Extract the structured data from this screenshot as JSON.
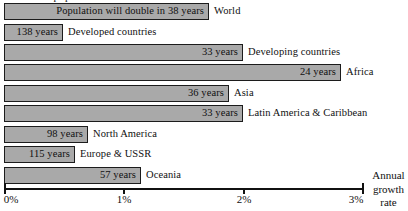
{
  "chart_data": {
    "type": "bar",
    "orientation": "horizontal",
    "title": "",
    "xlabel": "Annual growth rate",
    "ylabel": "",
    "xlim": [
      0,
      3
    ],
    "xunit": "%",
    "grid": false,
    "legend": null,
    "tick_labels": [
      "0%",
      "1%",
      "2%",
      "3%"
    ],
    "tick_values": [
      0,
      1,
      2,
      3
    ],
    "categories": [
      "World",
      "Developed countries",
      "Developing countries",
      "Africa",
      "Asia",
      "Latin America & Caribbean",
      "North America",
      "Europe & USSR",
      "Oceania"
    ],
    "values": [
      1.7,
      0.5,
      2.0,
      2.8,
      1.9,
      2.0,
      0.7,
      0.6,
      1.2
    ],
    "data_labels": [
      "Population will double in 38 years",
      "138 years",
      "33 years",
      "24 years",
      "36 years",
      "33 years",
      "98 years",
      "115 years",
      "57 years"
    ],
    "doubling_years": [
      38,
      138,
      33,
      24,
      36,
      33,
      98,
      115,
      57
    ],
    "bar_fill": "#a9a9a9",
    "bar_stroke": "#1c1c1c",
    "axis_color": "#111111"
  },
  "axis": {
    "caption_line1": "Annual",
    "caption_line2": "growth",
    "caption_line3": "rate",
    "ticks": [
      {
        "label": "0%",
        "x": 4
      },
      {
        "label": "1%",
        "x": 123
      },
      {
        "label": "2%",
        "x": 243
      },
      {
        "label": "3%",
        "x": 362
      }
    ]
  },
  "rows": [
    {
      "label": "World",
      "value_label": "Population will double in 38 years",
      "top": 3,
      "bar_end": 209
    },
    {
      "label": "Developed countries",
      "value_label": "138 years",
      "top": 24,
      "bar_end": 63
    },
    {
      "label": "Developing countries",
      "value_label": "33 years",
      "top": 44,
      "bar_end": 243
    },
    {
      "label": "Africa",
      "value_label": "24 years",
      "top": 64,
      "bar_end": 341
    },
    {
      "label": "Asia",
      "value_label": "36 years",
      "top": 85,
      "bar_end": 229
    },
    {
      "label": "Latin America & Caribbean",
      "value_label": "33 years",
      "top": 105,
      "bar_end": 243
    },
    {
      "label": "North America",
      "value_label": "98 years",
      "top": 126,
      "bar_end": 88
    },
    {
      "label": "Europe & USSR",
      "value_label": "115 years",
      "top": 146,
      "bar_end": 75
    },
    {
      "label": "Oceania",
      "value_label": "57 years",
      "top": 167,
      "bar_end": 141
    }
  ],
  "clipped_header": {
    "text": "world population"
  }
}
